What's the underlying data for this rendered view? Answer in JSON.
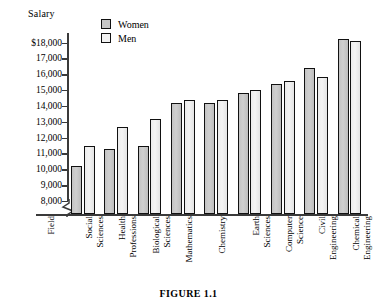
{
  "figure": {
    "caption": "FIGURE 1.1",
    "y_axis_title": "Salary",
    "x_axis_title": "Field"
  },
  "legend": {
    "position": "top-center",
    "entries": [
      {
        "label": "Women",
        "color": "#c6c6c6",
        "icon": "legend-swatch-icon"
      },
      {
        "label": "Men",
        "color": "#f2f2f2",
        "icon": "legend-swatch-icon"
      }
    ]
  },
  "y_ticks": [
    "$18,000",
    "17,000",
    "16,000",
    "15,000",
    "14,000",
    "13,000",
    "12,000",
    "11,000",
    "10,000",
    "9,000",
    "8,000"
  ],
  "chart_data": {
    "type": "bar",
    "title": "FIGURE 1.1",
    "xlabel": "Field",
    "ylabel": "Salary",
    "ylim": [
      8000,
      18600
    ],
    "axis_break": true,
    "grid": false,
    "legend_position": "top-center",
    "categories": [
      "Social Sciences",
      "Health Professions",
      "Biological Sciences",
      "Mathematics",
      "Chemistry",
      "Earth Sciences",
      "Computer Science",
      "Civil Engineering",
      "Chemical Engineering"
    ],
    "series": [
      {
        "name": "Women",
        "values": [
          10200,
          11300,
          11500,
          14200,
          14200,
          14800,
          15400,
          16400,
          18200
        ]
      },
      {
        "name": "Men",
        "values": [
          11500,
          12700,
          13200,
          14400,
          14400,
          15000,
          15600,
          15800,
          18100
        ]
      }
    ]
  }
}
